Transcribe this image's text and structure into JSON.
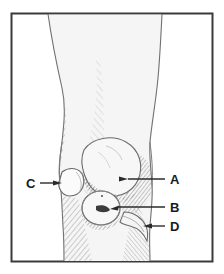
{
  "figure": {
    "frame": {
      "border_color": "#3a3a3a",
      "background": "#ffffff",
      "x": 11,
      "y": 13,
      "width": 202,
      "height": 249
    },
    "palette": {
      "skin_fill": "#f2f2f2",
      "skin_fill_light": "#fafafa",
      "hatch_line": "#9a9a9a",
      "hatch_line_dark": "#6f6f6f",
      "outline": "#6a6a6a",
      "label_text": "#1a1a1a",
      "leader_line": "#2b2b2b"
    },
    "labels": [
      {
        "id": "A",
        "text": "A",
        "text_x": 170,
        "text_y": 183,
        "leader": {
          "x1": 165,
          "y1": 179,
          "x2": 128,
          "y2": 179
        },
        "arrow_tip": {
          "x": 103,
          "y": 181
        },
        "arrow_from": {
          "x": 128,
          "y": 179
        },
        "direction": "left",
        "target": "patella-prominence"
      },
      {
        "id": "B",
        "text": "B",
        "text_x": 170,
        "text_y": 211,
        "leader": {
          "x1": 165,
          "y1": 207,
          "x2": 118,
          "y2": 207
        },
        "arrow_tip": {
          "x": 99,
          "y": 209
        },
        "arrow_from": {
          "x": 118,
          "y": 207
        },
        "direction": "left",
        "target": "circular-swelling"
      },
      {
        "id": "C",
        "text": "C",
        "text_x": 27,
        "text_y": 187,
        "leader": {
          "x1": 40,
          "y1": 183,
          "x2": 55,
          "y2": 183
        },
        "arrow_tip": {
          "x": 62,
          "y": 183
        },
        "arrow_from": {
          "x": 40,
          "y": 183
        },
        "direction": "right",
        "target": "lateral-bump"
      },
      {
        "id": "D",
        "text": "D",
        "text_x": 170,
        "text_y": 230,
        "leader": {
          "x1": 165,
          "y1": 226,
          "x2": 152,
          "y2": 226
        },
        "arrow_tip": {
          "x": 141,
          "y": 226
        },
        "arrow_from": {
          "x": 158,
          "y": 226
        },
        "direction": "left",
        "target": "tibial-tuberosity-contour"
      }
    ]
  }
}
